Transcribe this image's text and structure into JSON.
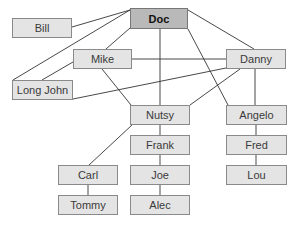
{
  "diagram": {
    "type": "network",
    "nodes": [
      {
        "id": "doc",
        "label": "Doc",
        "root": true
      },
      {
        "id": "bill",
        "label": "Bill"
      },
      {
        "id": "mike",
        "label": "Mike"
      },
      {
        "id": "danny",
        "label": "Danny"
      },
      {
        "id": "longjohn",
        "label": "Long John"
      },
      {
        "id": "nutsy",
        "label": "Nutsy"
      },
      {
        "id": "angelo",
        "label": "Angelo"
      },
      {
        "id": "frank",
        "label": "Frank"
      },
      {
        "id": "fred",
        "label": "Fred"
      },
      {
        "id": "carl",
        "label": "Carl"
      },
      {
        "id": "joe",
        "label": "Joe"
      },
      {
        "id": "lou",
        "label": "Lou"
      },
      {
        "id": "tommy",
        "label": "Tommy"
      },
      {
        "id": "alec",
        "label": "Alec"
      }
    ],
    "edges": [
      [
        "doc",
        "bill"
      ],
      [
        "doc",
        "mike"
      ],
      [
        "doc",
        "longjohn"
      ],
      [
        "doc",
        "danny"
      ],
      [
        "doc",
        "nutsy"
      ],
      [
        "doc",
        "angelo"
      ],
      [
        "mike",
        "longjohn"
      ],
      [
        "mike",
        "danny"
      ],
      [
        "mike",
        "nutsy"
      ],
      [
        "longjohn",
        "danny"
      ],
      [
        "danny",
        "nutsy"
      ],
      [
        "danny",
        "angelo"
      ],
      [
        "nutsy",
        "frank"
      ],
      [
        "nutsy",
        "carl"
      ],
      [
        "frank",
        "joe"
      ],
      [
        "joe",
        "alec"
      ],
      [
        "carl",
        "tommy"
      ],
      [
        "angelo",
        "fred"
      ],
      [
        "fred",
        "lou"
      ]
    ]
  }
}
